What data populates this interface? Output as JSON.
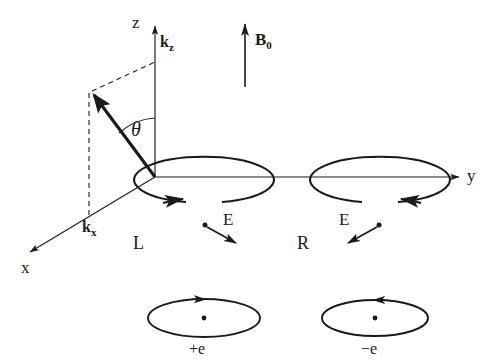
{
  "figure": {
    "line_color": "#1a1a1a",
    "background": "#ffffff"
  },
  "axes": {
    "z_label": "z",
    "y_label": "y",
    "x_label": "x",
    "kz_label": "k",
    "kz_sub": "z",
    "kx_label": "k",
    "kx_sub": "x",
    "angle_label": "θ"
  },
  "field": {
    "b0_label": "B",
    "b0_sub": "0"
  },
  "polarizations": [
    {
      "name": "left-circular",
      "label": "L",
      "vector_label": "E",
      "rotation": "clockwise-from-top-right"
    },
    {
      "name": "right-circular",
      "label": "R",
      "vector_label": "E",
      "rotation": "counterclockwise-from-top-left"
    }
  ],
  "charges": [
    {
      "name": "positive-charge",
      "label": "+e",
      "rotation": "arrow-right-at-top"
    },
    {
      "name": "negative-charge",
      "label": "−e",
      "rotation": "arrow-left-at-top"
    }
  ]
}
